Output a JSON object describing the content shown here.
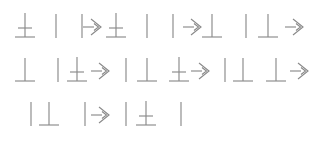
{
  "canvas": {
    "width": 312,
    "height": 143,
    "background_color": "#ffffff",
    "stroke_color": "#8a8a8a"
  },
  "legend": {
    "bar": "vertical-bar-glyph",
    "perp": "perpendicular-glyph",
    "double": "double-crossbar-glyph",
    "arrow": "right-block-arrow-glyph"
  },
  "rows": [
    {
      "index": 1,
      "top": 6,
      "text": "≛ | | ⇨ ≛ | | ⇨ ⊥ | ⊥ ⇨",
      "glyphs": [
        {
          "type": "double",
          "x": 12
        },
        {
          "type": "bar",
          "x": 43
        },
        {
          "type": "bar",
          "x": 69
        },
        {
          "type": "arrow",
          "x": 80
        },
        {
          "type": "double",
          "x": 103
        },
        {
          "type": "bar",
          "x": 134
        },
        {
          "type": "bar",
          "x": 160
        },
        {
          "type": "arrow",
          "x": 180
        },
        {
          "type": "perp",
          "x": 199
        },
        {
          "type": "bar",
          "x": 233
        },
        {
          "type": "perp",
          "x": 255
        },
        {
          "type": "arrow",
          "x": 282
        }
      ]
    },
    {
      "index": 2,
      "top": 50,
      "text": "⊥ | ≛ ⇨ | ⊥ ≛ ⇨ | ⊥ ⊥ ⇨",
      "glyphs": [
        {
          "type": "perp",
          "x": 12
        },
        {
          "type": "bar",
          "x": 45
        },
        {
          "type": "double",
          "x": 64
        },
        {
          "type": "arrow",
          "x": 88
        },
        {
          "type": "bar",
          "x": 113
        },
        {
          "type": "perp",
          "x": 134
        },
        {
          "type": "double",
          "x": 166
        },
        {
          "type": "arrow",
          "x": 188
        },
        {
          "type": "bar",
          "x": 212
        },
        {
          "type": "perp",
          "x": 230
        },
        {
          "type": "perp",
          "x": 263
        },
        {
          "type": "arrow",
          "x": 287
        }
      ]
    },
    {
      "index": 3,
      "top": 94,
      "text": "| ≛ | ⇨ | ≛ |",
      "glyphs": [
        {
          "type": "bar",
          "x": 18
        },
        {
          "type": "perp",
          "x": 36
        },
        {
          "type": "bar",
          "x": 72
        },
        {
          "type": "arrow",
          "x": 88
        },
        {
          "type": "bar",
          "x": 113
        },
        {
          "type": "double",
          "x": 133
        },
        {
          "type": "bar",
          "x": 168
        }
      ]
    }
  ]
}
